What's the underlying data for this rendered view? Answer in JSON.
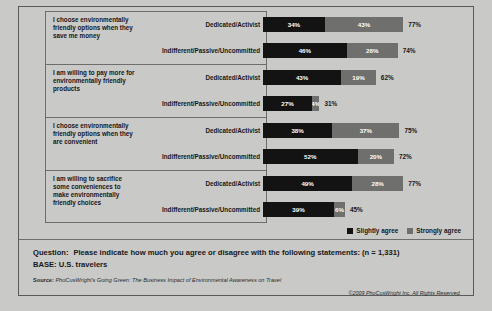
{
  "legend": {
    "items": [
      {
        "label": "Slightly agree",
        "color": "#131313",
        "icon": "square-swatch-icon"
      },
      {
        "label": "Strongly agree",
        "color": "#6f6f6d",
        "icon": "square-swatch-icon"
      }
    ]
  },
  "footer": {
    "question_lead": "Question:",
    "question_text": "Please indicate how much you agree or disagree with the following statements: (n = 1,331)",
    "base_text": "BASE: U.S. travelers",
    "source_lead": "Source:",
    "source_text": "PhoCusWright's Going Green: The Business Impact of Environmental Awareness on Travel",
    "copyright": "©2009 PhoCusWright Inc. All Rights Reserved."
  },
  "chart_data": {
    "type": "bar",
    "orientation": "horizontal",
    "stacked": true,
    "title": "",
    "xlabel": "",
    "ylabel": "",
    "xlim": [
      0,
      100
    ],
    "grid": false,
    "legend_position": "bottom-right",
    "value_suffix": "%",
    "series": [
      {
        "name": "Slightly agree",
        "color": "#131313"
      },
      {
        "name": "Strongly agree",
        "color": "#6f6f6d"
      }
    ],
    "groups": [
      {
        "statement": "I choose environmentally friendly options when they save me money",
        "rows": [
          {
            "category": "Dedicated/Activist",
            "slightly_agree": 34,
            "strongly_agree": 43,
            "total": 77,
            "slightly_label": "34%",
            "strongly_label": "43%",
            "total_label": "77%"
          },
          {
            "category": "Indifferent/Passive/Uncommitted",
            "slightly_agree": 46,
            "strongly_agree": 28,
            "total": 74,
            "slightly_label": "46%",
            "strongly_label": "28%",
            "total_label": "74%"
          }
        ]
      },
      {
        "statement": "I am willing to pay more for environmentally friendly products",
        "rows": [
          {
            "category": "Dedicated/Activist",
            "slightly_agree": 43,
            "strongly_agree": 19,
            "total": 62,
            "slightly_label": "43%",
            "strongly_label": "19%",
            "total_label": "62%"
          },
          {
            "category": "Indifferent/Passive/Uncommitted",
            "slightly_agree": 27,
            "strongly_agree": 4,
            "total": 31,
            "slightly_label": "27%",
            "strongly_label": "4%",
            "total_label": "31%"
          }
        ]
      },
      {
        "statement": "I choose environmentally friendly options when they are convenient",
        "rows": [
          {
            "category": "Dedicated/Activist",
            "slightly_agree": 38,
            "strongly_agree": 37,
            "total": 75,
            "slightly_label": "38%",
            "strongly_label": "37%",
            "total_label": "75%"
          },
          {
            "category": "Indifferent/Passive/Uncommitted",
            "slightly_agree": 52,
            "strongly_agree": 20,
            "total": 72,
            "slightly_label": "52%",
            "strongly_label": "20%",
            "total_label": "72%"
          }
        ]
      },
      {
        "statement": "I am willing to sacrifice some conveniences to make environmentally friendly choices",
        "rows": [
          {
            "category": "Dedicated/Activist",
            "slightly_agree": 49,
            "strongly_agree": 28,
            "total": 77,
            "slightly_label": "49%",
            "strongly_label": "28%",
            "total_label": "77%"
          },
          {
            "category": "Indifferent/Passive/Uncommitted",
            "slightly_agree": 39,
            "strongly_agree": 6,
            "total": 45,
            "slightly_label": "39%",
            "strongly_label": "6%",
            "total_label": "45%"
          }
        ]
      }
    ]
  }
}
